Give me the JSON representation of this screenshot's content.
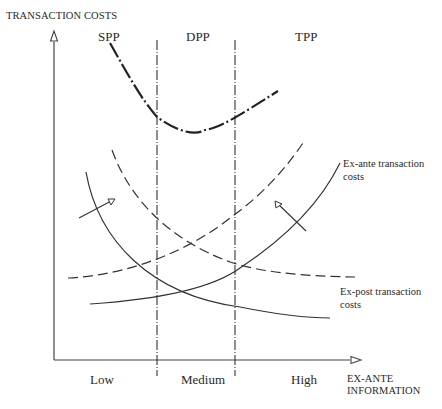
{
  "diagram": {
    "title_axis_y": "TRANSACTION COSTS",
    "axis_x_label_line1": "EX-ANTE",
    "axis_x_label_line2": "INFORMATION",
    "regions": [
      {
        "id": "spp",
        "label": "SPP"
      },
      {
        "id": "dpp",
        "label": "DPP"
      },
      {
        "id": "tpp",
        "label": "TPP"
      }
    ],
    "x_ticks": [
      {
        "label": "Low"
      },
      {
        "label": "Medium"
      },
      {
        "label": "High"
      }
    ],
    "curves": {
      "ex_ante": {
        "label_line1": "Ex-ante transaction",
        "label_line2": "costs"
      },
      "ex_post": {
        "label_line1": "Ex-post transaction",
        "label_line2": "costs"
      },
      "total": {
        "label": "Total transaction costs (dash-dot, U-shaped)"
      }
    },
    "colors": {
      "line": "#333333",
      "background": "#ffffff"
    }
  }
}
